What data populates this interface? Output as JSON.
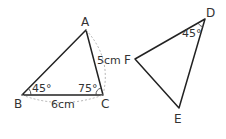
{
  "diagram": {
    "triangle_abc": {
      "vertices": {
        "A": {
          "label": "A",
          "x": 86,
          "y": 30
        },
        "B": {
          "label": "B",
          "x": 22,
          "y": 95
        },
        "C": {
          "label": "C",
          "x": 103,
          "y": 95
        }
      },
      "angle_b": "45°",
      "angle_c": "75°",
      "side_bc": "6cm",
      "side_ac": "5cm"
    },
    "triangle_def": {
      "vertices": {
        "D": {
          "label": "D",
          "x": 205,
          "y": 19
        },
        "E": {
          "label": "E",
          "x": 179,
          "y": 108
        },
        "F": {
          "label": "F",
          "x": 135,
          "y": 59
        }
      },
      "angle_d": "45°"
    },
    "colors": {
      "stroke": "#222222",
      "dashed": "#aaaaaa",
      "text": "#333333"
    }
  }
}
